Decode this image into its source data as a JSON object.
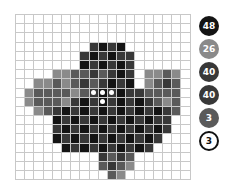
{
  "puzzle": {
    "cols": 19,
    "rows": 18,
    "shades": {
      "0": "#ffffff",
      "1": "#8a8a8a",
      "2": "#5a5a5a",
      "3": "#383838",
      "4": "#141414"
    },
    "grid": [
      "0000000000000000000",
      "0000000000000000000",
      "0000000000000000000",
      "0000000034340000000",
      "0000000343433000000",
      "0000000434343000000",
      "0000112232343011210",
      "0011212323434012320",
      "0122221234343322220",
      "0122213434343432120",
      "0012343434343434320",
      "0000434343434343300",
      "0000343434343434300",
      "0000434343434343000",
      "0000043434343430000",
      "0000000003232000000",
      "0000000002321000000",
      "0000000000210000000"
    ],
    "dots": [
      [
        8,
        8
      ],
      [
        9,
        8
      ],
      [
        10,
        8
      ],
      [
        9,
        9
      ]
    ]
  },
  "palette": [
    {
      "count": "48",
      "color": "#141414",
      "outline": false
    },
    {
      "count": "26",
      "color": "#8a8a8a",
      "outline": false
    },
    {
      "count": "40",
      "color": "#383838",
      "outline": false
    },
    {
      "count": "40",
      "color": "#383838",
      "outline": false
    },
    {
      "count": "3",
      "color": "#5a5a5a",
      "outline": false
    },
    {
      "count": "3",
      "color": "#ffffff",
      "outline": true
    }
  ]
}
